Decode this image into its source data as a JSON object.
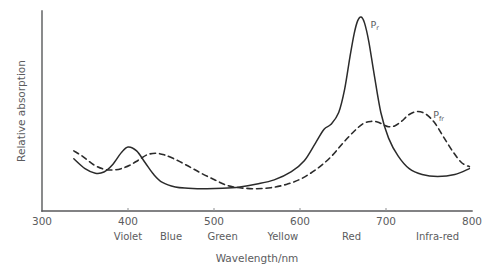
{
  "chart_data": {
    "type": "line",
    "title": "",
    "xlabel": "Wavelength/nm",
    "ylabel": "Relative absorption",
    "xlim": [
      300,
      800
    ],
    "ylim": [
      0,
      1
    ],
    "grid": false,
    "legend": "inline-annotations",
    "xticks": [
      300,
      400,
      500,
      600,
      700,
      800
    ],
    "xtick_labels": [
      "300",
      "400",
      "500",
      "600",
      "700",
      "800"
    ],
    "yticks": [],
    "ytick_labels": [],
    "band_labels": [
      {
        "name": "Violet",
        "wavelength": 400
      },
      {
        "name": "Blue",
        "wavelength": 450
      },
      {
        "name": "Green",
        "wavelength": 510
      },
      {
        "name": "Yellow",
        "wavelength": 580
      },
      {
        "name": "Red",
        "wavelength": 660
      },
      {
        "name": "Infra-red",
        "wavelength": 760
      }
    ],
    "annotations": [
      {
        "text": "P",
        "subscript": "r",
        "wavelength": 682,
        "value": 0.93
      },
      {
        "text": "P",
        "subscript": "fr",
        "wavelength": 755,
        "value": 0.47
      }
    ],
    "series": [
      {
        "name": "Pr",
        "style": "solid",
        "label": "P",
        "label_subscript": "r",
        "x": [
          337,
          350,
          362,
          372,
          382,
          392,
          400,
          410,
          420,
          430,
          440,
          455,
          470,
          490,
          510,
          530,
          550,
          570,
          590,
          605,
          618,
          628,
          636,
          645,
          652,
          658,
          663,
          667,
          671,
          675,
          680,
          686,
          694,
          703,
          714,
          727,
          742,
          760,
          780,
          797
        ],
        "y": [
          0.265,
          0.215,
          0.192,
          0.198,
          0.235,
          0.295,
          0.325,
          0.305,
          0.245,
          0.185,
          0.145,
          0.122,
          0.116,
          0.113,
          0.115,
          0.122,
          0.137,
          0.158,
          0.2,
          0.255,
          0.345,
          0.415,
          0.44,
          0.5,
          0.62,
          0.78,
          0.9,
          0.965,
          0.985,
          0.955,
          0.86,
          0.7,
          0.5,
          0.37,
          0.28,
          0.215,
          0.185,
          0.175,
          0.185,
          0.215
        ]
      },
      {
        "name": "Pfr",
        "style": "dashed",
        "label": "P",
        "label_subscript": "fr",
        "x": [
          337,
          348,
          360,
          372,
          382,
          392,
          402,
          412,
          422,
          432,
          442,
          455,
          470,
          485,
          500,
          515,
          530,
          548,
          566,
          584,
          602,
          620,
          636,
          650,
          663,
          674,
          683,
          690,
          697,
          703,
          710,
          718,
          727,
          737,
          747,
          757,
          767,
          778,
          788,
          797
        ],
        "y": [
          0.305,
          0.275,
          0.235,
          0.212,
          0.208,
          0.215,
          0.232,
          0.258,
          0.285,
          0.293,
          0.285,
          0.262,
          0.228,
          0.192,
          0.16,
          0.13,
          0.118,
          0.113,
          0.118,
          0.135,
          0.165,
          0.215,
          0.275,
          0.345,
          0.405,
          0.445,
          0.455,
          0.452,
          0.438,
          0.428,
          0.432,
          0.455,
          0.49,
          0.505,
          0.49,
          0.445,
          0.375,
          0.3,
          0.245,
          0.225
        ]
      }
    ]
  },
  "axes": {
    "y_title": "Relative absorption",
    "x_title": "Wavelength/nm"
  }
}
